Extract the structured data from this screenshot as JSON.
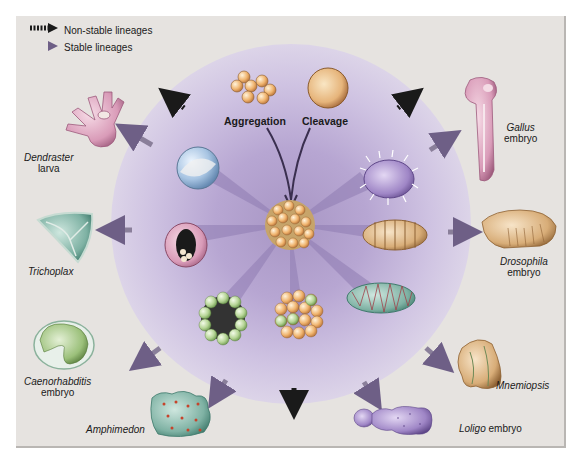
{
  "legend": {
    "items": [
      {
        "label": "Non-stable lineages",
        "style": "dashed-arrow",
        "color": "#1a1a1a"
      },
      {
        "label": "Stable lineages",
        "style": "solid-arrow",
        "color": "#8a7f9a"
      }
    ]
  },
  "center": {
    "origins": [
      {
        "label": "Aggregation",
        "icon": "cell-aggregate-icon"
      },
      {
        "label": "Cleavage",
        "icon": "single-cell-icon"
      }
    ],
    "core": "multicellular-cluster-icon"
  },
  "organisms": [
    {
      "name": "Dendraster",
      "suffix": "larva",
      "lineage": "stable"
    },
    {
      "name": "Trichoplax",
      "suffix": "",
      "lineage": "stable"
    },
    {
      "name": "Caenorhabditis",
      "suffix": "embryo",
      "lineage": "stable"
    },
    {
      "name": "Amphimedon",
      "suffix": "",
      "lineage": "stable"
    },
    {
      "name": "Loligo",
      "suffix": "embryo",
      "lineage": "stable"
    },
    {
      "name": "Mnemiopsis",
      "suffix": "",
      "lineage": "stable"
    },
    {
      "name": "Drosophila",
      "suffix": "embryo",
      "lineage": "stable"
    },
    {
      "name": "Gallus",
      "suffix": "embryo",
      "lineage": "stable"
    }
  ],
  "non_stable_arrows": [
    "top-left",
    "top-right",
    "bottom"
  ],
  "colors": {
    "background": "#e6e3e0",
    "halo": "#b7a6d2",
    "stable_arrow": "#8a7f9a",
    "nonstable_arrow": "#1a1a1a",
    "cell_orange": "#e9a35a",
    "cell_green": "#a9c98a",
    "cell_blue": "#9ab8d8"
  }
}
